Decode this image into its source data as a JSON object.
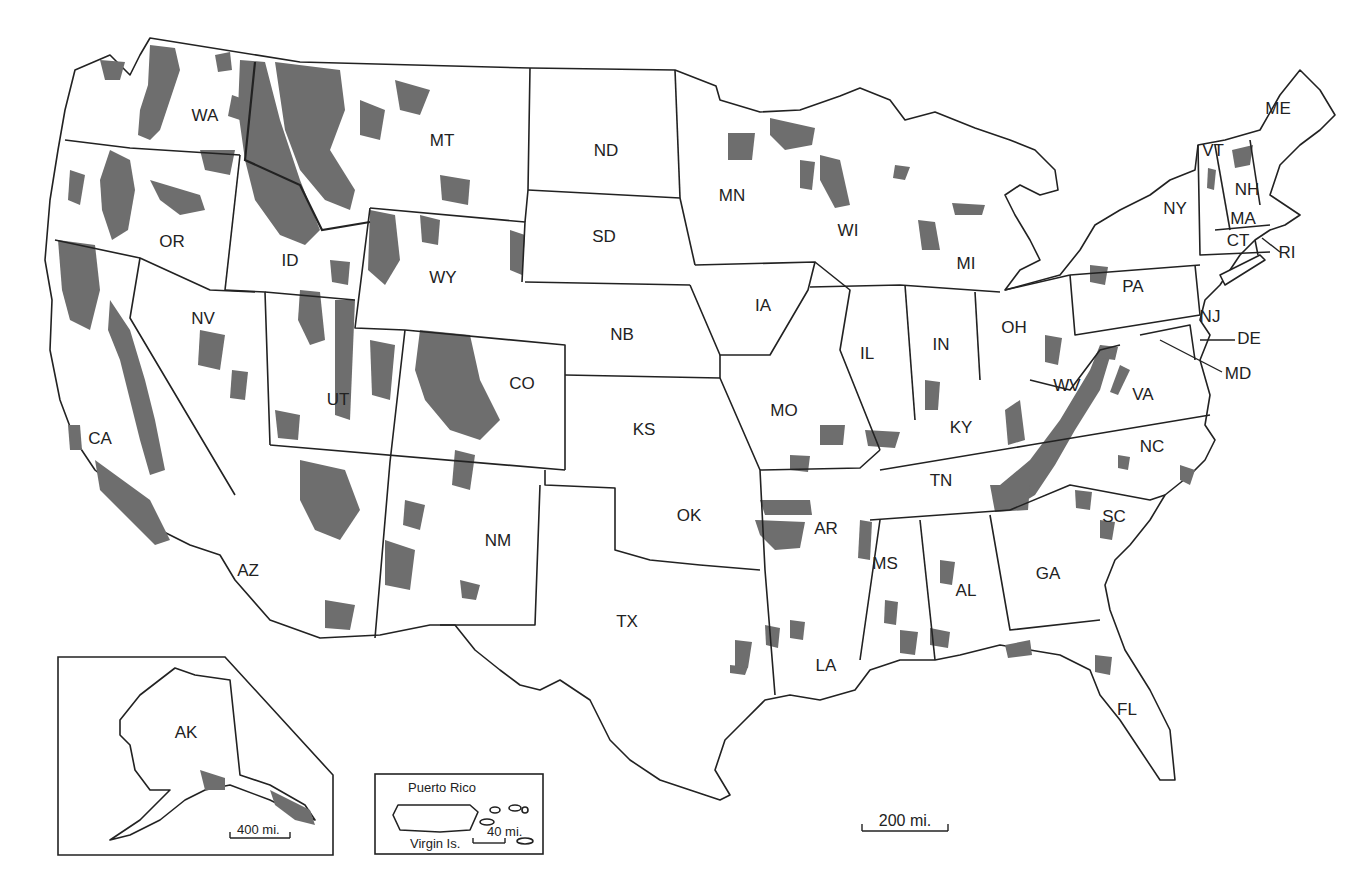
{
  "map": {
    "colors": {
      "forest_fill": "#6e6e6e",
      "state_stroke": "#222222",
      "background": "#ffffff"
    },
    "states": [
      {
        "abbr": "WA",
        "x": 205,
        "y": 117
      },
      {
        "abbr": "OR",
        "x": 172,
        "y": 243
      },
      {
        "abbr": "CA",
        "x": 100,
        "y": 440
      },
      {
        "abbr": "ID",
        "x": 290,
        "y": 262
      },
      {
        "abbr": "NV",
        "x": 203,
        "y": 320
      },
      {
        "abbr": "MT",
        "x": 442,
        "y": 142
      },
      {
        "abbr": "WY",
        "x": 443,
        "y": 279
      },
      {
        "abbr": "UT",
        "x": 338,
        "y": 401
      },
      {
        "abbr": "AZ",
        "x": 248,
        "y": 572
      },
      {
        "abbr": "CO",
        "x": 522,
        "y": 385
      },
      {
        "abbr": "NM",
        "x": 498,
        "y": 542
      },
      {
        "abbr": "ND",
        "x": 606,
        "y": 152
      },
      {
        "abbr": "SD",
        "x": 604,
        "y": 238
      },
      {
        "abbr": "NB",
        "x": 622,
        "y": 336
      },
      {
        "abbr": "KS",
        "x": 644,
        "y": 431
      },
      {
        "abbr": "OK",
        "x": 689,
        "y": 517
      },
      {
        "abbr": "TX",
        "x": 627,
        "y": 623
      },
      {
        "abbr": "MN",
        "x": 732,
        "y": 197
      },
      {
        "abbr": "IA",
        "x": 763,
        "y": 307
      },
      {
        "abbr": "MO",
        "x": 784,
        "y": 412
      },
      {
        "abbr": "AR",
        "x": 826,
        "y": 530
      },
      {
        "abbr": "LA",
        "x": 826,
        "y": 667
      },
      {
        "abbr": "WI",
        "x": 848,
        "y": 232
      },
      {
        "abbr": "IL",
        "x": 867,
        "y": 355
      },
      {
        "abbr": "MI",
        "x": 966,
        "y": 265
      },
      {
        "abbr": "IN",
        "x": 941,
        "y": 346
      },
      {
        "abbr": "OH",
        "x": 1014,
        "y": 329
      },
      {
        "abbr": "KY",
        "x": 961,
        "y": 429
      },
      {
        "abbr": "TN",
        "x": 941,
        "y": 482
      },
      {
        "abbr": "MS",
        "x": 885,
        "y": 565
      },
      {
        "abbr": "AL",
        "x": 966,
        "y": 592
      },
      {
        "abbr": "GA",
        "x": 1048,
        "y": 575
      },
      {
        "abbr": "FL",
        "x": 1127,
        "y": 711
      },
      {
        "abbr": "SC",
        "x": 1114,
        "y": 518
      },
      {
        "abbr": "NC",
        "x": 1152,
        "y": 448
      },
      {
        "abbr": "VA",
        "x": 1143,
        "y": 396
      },
      {
        "abbr": "WV",
        "x": 1067,
        "y": 387
      },
      {
        "abbr": "PA",
        "x": 1133,
        "y": 288
      },
      {
        "abbr": "NY",
        "x": 1175,
        "y": 210
      },
      {
        "abbr": "VT",
        "x": 1213,
        "y": 152
      },
      {
        "abbr": "NH",
        "x": 1247,
        "y": 191
      },
      {
        "abbr": "ME",
        "x": 1278,
        "y": 110
      },
      {
        "abbr": "MA",
        "x": 1243,
        "y": 220
      },
      {
        "abbr": "CT",
        "x": 1238,
        "y": 242
      },
      {
        "abbr": "NJ",
        "x": 1210,
        "y": 318
      },
      {
        "abbr": "AK",
        "x": 186,
        "y": 734
      }
    ],
    "callouts": [
      {
        "abbr": "RI",
        "x": 1287,
        "y": 254
      },
      {
        "abbr": "DE",
        "x": 1249,
        "y": 340
      },
      {
        "abbr": "MD",
        "x": 1238,
        "y": 375
      }
    ],
    "insets": {
      "alaska": {
        "label": "AK",
        "scale": "400 mi."
      },
      "puerto_rico": {
        "title": "Puerto Rico",
        "subtitle": "Virgin Is.",
        "scale": "40 mi."
      }
    },
    "scale_bar": {
      "label": "200 mi."
    }
  }
}
